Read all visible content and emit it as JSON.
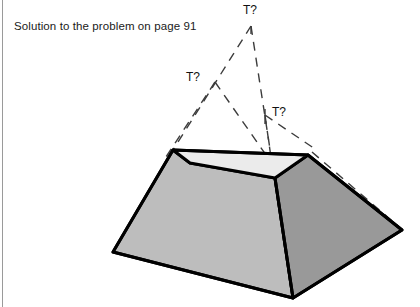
{
  "page": {
    "background_color": "#ffffff",
    "rule_color": "#9a9a9a"
  },
  "caption": {
    "text": "Solution to the problem on page 91"
  },
  "figure": {
    "labels": {
      "apex": "T?",
      "left_vertex": "T?",
      "right_vertex": "T?"
    },
    "colors": {
      "top_face": "#ebebeb",
      "left_face": "#bdbdbd",
      "right_face": "#999999",
      "outline": "#000000",
      "dashed": "#3c3c3c"
    },
    "geometry": {
      "top_face": [
        [
          173,
          150
        ],
        [
          308,
          155
        ],
        [
          275,
          178
        ],
        [
          190,
          163
        ]
      ],
      "left_face": [
        [
          173,
          150
        ],
        [
          190,
          163
        ],
        [
          275,
          178
        ],
        [
          293,
          298
        ],
        [
          113,
          252
        ]
      ],
      "right_face": [
        [
          275,
          178
        ],
        [
          308,
          155
        ],
        [
          402,
          230
        ],
        [
          293,
          298
        ]
      ],
      "solid_outline": [
        [
          173,
          150
        ],
        [
          308,
          155
        ],
        [
          402,
          230
        ],
        [
          293,
          298
        ],
        [
          113,
          252
        ]
      ],
      "dashed_segments": [
        [
          [
            251,
            26
          ],
          [
            173,
            150
          ]
        ],
        [
          [
            251,
            26
          ],
          [
            293,
            298
          ]
        ],
        [
          [
            215,
            82
          ],
          [
            166,
            157
          ]
        ],
        [
          [
            215,
            82
          ],
          [
            287,
            185
          ]
        ],
        [
          [
            265,
            115
          ],
          [
            275,
            186
          ]
        ],
        [
          [
            265,
            115
          ],
          [
            316,
            150
          ]
        ],
        [
          [
            308,
            155
          ],
          [
            398,
            226
          ]
        ]
      ],
      "apex_point": [
        251,
        26
      ],
      "left_aux_point": [
        215,
        82
      ],
      "right_aux_point": [
        265,
        115
      ]
    }
  }
}
